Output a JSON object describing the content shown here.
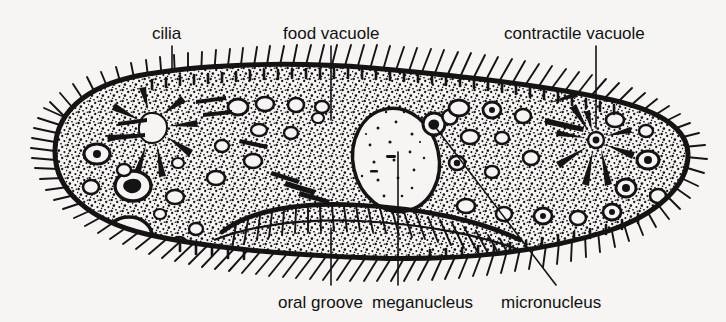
{
  "figure": {
    "background_color": "#f6f5f3",
    "ink_color": "#111111",
    "width": 726,
    "height": 322
  },
  "labels": [
    {
      "id": "cilia",
      "text": "cilia",
      "x": 152,
      "y": 26
    },
    {
      "id": "food-vacuole",
      "text": "food vacuole",
      "x": 283,
      "y": 26
    },
    {
      "id": "contractile-vacuole",
      "text": "contractile vacuole",
      "x": 504,
      "y": 26
    },
    {
      "id": "oral-groove",
      "text": "oral groove",
      "x": 278,
      "y": 295
    },
    {
      "id": "meganucleus",
      "text": "meganucleus",
      "x": 372,
      "y": 295
    },
    {
      "id": "micronucleus",
      "text": "micronucleus",
      "x": 501,
      "y": 295
    }
  ],
  "leader_lines": [
    {
      "id": "leader-cilia",
      "points": "172,46 172,72"
    },
    {
      "id": "leader-food-vacuole",
      "points": "331,46 331,120"
    },
    {
      "id": "leader-contractile-vacuole",
      "points": "596,46 596,128"
    },
    {
      "id": "leader-oral-groove",
      "points": "331,285 331,228"
    },
    {
      "id": "leader-meganucleus",
      "points": "398,285 398,152"
    },
    {
      "id": "leader-micronucleus",
      "points": "556,285 433,124"
    }
  ],
  "structures": {
    "cell_body": "elongated slipper-shaped outline",
    "pellicle": "thick dark membrane band with ciliary fringe",
    "cytoplasm": "dense stipple of fine dots",
    "contractile_vacuoles": [
      {
        "id": "contractile-vacuole-left",
        "cx": 156,
        "cy": 128,
        "radiating_canals": 8
      },
      {
        "id": "contractile-vacuole-right",
        "cx": 596,
        "cy": 140,
        "radiating_canals": 8
      }
    ],
    "meganucleus": {
      "cx": 396,
      "cy": 160,
      "rx": 42,
      "ry": 52
    },
    "micronucleus": {
      "cx": 434,
      "cy": 124,
      "r": 11
    },
    "oral_groove": {
      "description": "ciliated indentation along lower middle of body"
    },
    "food_vacuole_count": 34
  }
}
